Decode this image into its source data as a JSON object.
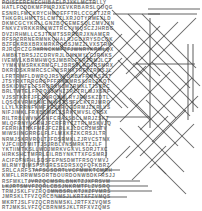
{
  "puzzle": {
    "title": "Word Search Grid",
    "type": "word-search",
    "columns": 38,
    "rows": 40,
    "cell_size_px": 5.25,
    "letter_color": "#6e6e6e",
    "mark_color": "#4a4a4a",
    "background_color": "#ffffff",
    "rows_text": [
      "POISEERENECHIBAELPJXKLMCTRLLY",
      "HATLFCDDKMFPMRJXEVKRBARSLOUQG",
      "ESNRLFMCKRYCHMDEFFTRLCCGSTJZR",
      "THKGRLHMTTSLCMTZLXRJOTYRMEXLD",
      "DKMCGCYKRLLGNZBQGEMESQLCMVJXN",
      "FNKVZVRKKRMXWZTRCYVMQSCZJHRBG",
      "DVZIRHMLLCSJTRMTSSRRBRJXNAMER",
      "RFSFZRRNERMNKQHALRJGDXRYSDCQK",
      "BZFEKRBXBRXMRKRQBSJMZZLVXSTRM",
      "RJRCRCZGRXRNCKMFZFJWNRYKRMLQX",
      "AMBKTBRSJZCDRVRJLGMXMYLCJRNKS",
      "IVEMVLKBRMHWQSJMBRLFKRZRMJLCT",
      "YYMKVMSRKKRMGFLJBRSVLKDJRSMRX",
      "DKRIDSKRMRCSCHWSRNXTRFXZRMSJL",
      "LFRTRMFLDWRQJRSVVDRBVFRMKSZJT",
      "JTSYRXTRRGRSPFFRKGMRSXJRLZKQT",
      "BSKIDWTELFSRQRXNZMZRMKLTJSVRC",
      "BRLTWTELFRRQSJMNZZRCTRLMJXSRF",
      "VJSSTKRFJFCCVRQSMLRYJRMSKZDTL",
      "LQSCKVRMBNICIMWSTSSFLCKTRJMRQ",
      "LLYLKRRNFKMFXRJSRQGDRMJZKRLVS",
      "NIFJIMKLFRXBDMRLJSRKTMVSLQRSX",
      "RILTRBLWVNYGNFCRAJSBCLMRJZSKT",
      "MLQFRNYVGRHJFCRFRYCZTRLMSKVJQ",
      "FERRIATNKFMFJFCZRLKJLDCRJMSTV",
      "MIWSIINGRRGLFLFLMXKFZKCRSJLTR",
      "NRMJSKRVRQLTJFDSRMKLZJRVCSTNX",
      "VJFCIIDTMITTJSJRBLVNSMRKTZJLF",
      "YKTIIMTKSLLWDJMRKVGKVLSDRJTXC",
      "HIRKSHCTMFRLEILRBYNKTTXFGSMRJ",
      "ACIFDFNFHLSDSFEPNSDMTFRSQYMVJ",
      "MLRMYDIMSPSIGRESEDRSXQFQFKBRZ",
      "SRLCARFSTAFSGSDRTLVCFMWKTCMRH",
      "KMFLLRRWMSORTBOURDONWBDKFRSJJ",
      "RSFMKLTJVRZQCMSRLBNKTZJXFRSVM",
      "LKJRTSMVFZQRLCBSJNKRMTFLZVSRQ",
      "TRMJSKLFVZRQCMNBSRLKTJXZFVMRS",
      "JMRSKLTFVZQRCBNMSJLKRTXFZVMQS",
      "MKRTJSLFVZQCRBNMSKLJRTFXZVQMS",
      "RTJMKSLVFZQCBRNMSJKLTRFXVZQMS"
    ],
    "marks": [
      {
        "name": "word-strike-1",
        "x1": 2,
        "y1": 3,
        "x2": 96,
        "y2": 3,
        "orientation": "horizontal"
      },
      {
        "name": "word-strike-2",
        "x1": 148,
        "y1": 9,
        "x2": 200,
        "y2": 9,
        "orientation": "horizontal"
      },
      {
        "name": "word-strike-3",
        "x1": 148,
        "y1": 14,
        "x2": 197,
        "y2": 14,
        "orientation": "horizontal"
      },
      {
        "name": "word-strike-4",
        "x1": 113,
        "y1": 14,
        "x2": 160,
        "y2": 14,
        "orientation": "horizontal"
      },
      {
        "name": "word-strike-5",
        "x1": 35,
        "y1": 49,
        "x2": 110,
        "y2": 49,
        "orientation": "horizontal"
      },
      {
        "name": "word-strike-6",
        "x1": 133,
        "y1": 64,
        "x2": 195,
        "y2": 64,
        "orientation": "horizontal"
      },
      {
        "name": "word-strike-7",
        "x1": 107,
        "y1": 117,
        "x2": 150,
        "y2": 117,
        "orientation": "horizontal"
      },
      {
        "name": "word-strike-8",
        "x1": 33,
        "y1": 170,
        "x2": 120,
        "y2": 170,
        "orientation": "horizontal"
      },
      {
        "name": "word-strike-9",
        "x1": 28,
        "y1": 181,
        "x2": 140,
        "y2": 181,
        "orientation": "horizontal"
      },
      {
        "name": "word-strike-10",
        "x1": 2,
        "y1": 186,
        "x2": 148,
        "y2": 186,
        "orientation": "horizontal"
      },
      {
        "name": "word-strike-11",
        "x1": 48,
        "y1": 191,
        "x2": 152,
        "y2": 191,
        "orientation": "horizontal"
      },
      {
        "name": "word-strike-12",
        "x1": 57,
        "y1": 197,
        "x2": 127,
        "y2": 197,
        "orientation": "horizontal"
      },
      {
        "name": "word-strike-13",
        "x1": 16,
        "y1": 38,
        "x2": 16,
        "y2": 106,
        "orientation": "vertical"
      },
      {
        "name": "word-strike-14",
        "x1": 20,
        "y1": 57,
        "x2": 20,
        "y2": 160,
        "orientation": "vertical"
      },
      {
        "name": "word-strike-15",
        "x1": 24,
        "y1": 86,
        "x2": 24,
        "y2": 168,
        "orientation": "vertical"
      },
      {
        "name": "word-strike-16",
        "x1": 29,
        "y1": 86,
        "x2": 29,
        "y2": 168,
        "orientation": "vertical"
      },
      {
        "name": "word-strike-17",
        "x1": 38,
        "y1": 93,
        "x2": 38,
        "y2": 165,
        "orientation": "vertical"
      },
      {
        "name": "word-strike-18",
        "x1": 43,
        "y1": 100,
        "x2": 43,
        "y2": 165,
        "orientation": "vertical"
      },
      {
        "name": "word-strike-19",
        "x1": 48,
        "y1": 96,
        "x2": 48,
        "y2": 168,
        "orientation": "vertical"
      },
      {
        "name": "word-strike-20",
        "x1": 60,
        "y1": 93,
        "x2": 60,
        "y2": 143,
        "orientation": "vertical"
      },
      {
        "name": "word-strike-21",
        "x1": 64,
        "y1": 78,
        "x2": 64,
        "y2": 143,
        "orientation": "vertical"
      },
      {
        "name": "word-strike-22",
        "x1": 72,
        "y1": 100,
        "x2": 72,
        "y2": 148,
        "orientation": "vertical"
      },
      {
        "name": "word-strike-23",
        "x1": 100,
        "y1": 84,
        "x2": 100,
        "y2": 130,
        "orientation": "vertical"
      },
      {
        "name": "word-strike-24",
        "x1": 106,
        "y1": 119,
        "x2": 106,
        "y2": 158,
        "orientation": "vertical"
      },
      {
        "name": "word-strike-25",
        "x1": 150,
        "y1": 18,
        "x2": 150,
        "y2": 128,
        "orientation": "vertical"
      },
      {
        "name": "word-strike-26",
        "x1": 188,
        "y1": 44,
        "x2": 188,
        "y2": 120,
        "orientation": "vertical"
      },
      {
        "name": "word-strike-27",
        "x1": 193,
        "y1": 44,
        "x2": 193,
        "y2": 112,
        "orientation": "vertical"
      },
      {
        "name": "word-strike-28",
        "x1": 22,
        "y1": 6,
        "x2": 64,
        "y2": 48,
        "orientation": "diagonal-down"
      },
      {
        "name": "word-strike-29",
        "x1": 50,
        "y1": 8,
        "x2": 92,
        "y2": 50,
        "orientation": "diagonal-down"
      },
      {
        "name": "word-strike-30",
        "x1": 100,
        "y1": 16,
        "x2": 160,
        "y2": 76,
        "orientation": "diagonal-down"
      },
      {
        "name": "word-strike-31",
        "x1": 112,
        "y1": 10,
        "x2": 190,
        "y2": 88,
        "orientation": "diagonal-down"
      },
      {
        "name": "word-strike-32",
        "x1": 128,
        "y1": 14,
        "x2": 200,
        "y2": 86,
        "orientation": "diagonal-down"
      },
      {
        "name": "word-strike-33",
        "x1": 142,
        "y1": 14,
        "x2": 196,
        "y2": 68,
        "orientation": "diagonal-down"
      },
      {
        "name": "word-strike-34",
        "x1": 104,
        "y1": 36,
        "x2": 150,
        "y2": 82,
        "orientation": "diagonal-down"
      },
      {
        "name": "word-strike-35",
        "x1": 60,
        "y1": 46,
        "x2": 122,
        "y2": 108,
        "orientation": "diagonal-down"
      },
      {
        "name": "word-strike-36",
        "x1": 74,
        "y1": 54,
        "x2": 128,
        "y2": 108,
        "orientation": "diagonal-down"
      },
      {
        "name": "word-strike-37",
        "x1": 52,
        "y1": 66,
        "x2": 108,
        "y2": 122,
        "orientation": "diagonal-down"
      },
      {
        "name": "word-strike-38",
        "x1": 86,
        "y1": 56,
        "x2": 150,
        "y2": 120,
        "orientation": "diagonal-down"
      },
      {
        "name": "word-strike-39",
        "x1": 118,
        "y1": 60,
        "x2": 176,
        "y2": 118,
        "orientation": "diagonal-down"
      },
      {
        "name": "word-strike-40",
        "x1": 136,
        "y1": 62,
        "x2": 190,
        "y2": 116,
        "orientation": "diagonal-down"
      },
      {
        "name": "word-strike-41",
        "x1": 152,
        "y1": 62,
        "x2": 198,
        "y2": 108,
        "orientation": "diagonal-down"
      },
      {
        "name": "word-strike-42",
        "x1": 40,
        "y1": 78,
        "x2": 90,
        "y2": 128,
        "orientation": "diagonal-down"
      },
      {
        "name": "word-strike-43",
        "x1": 30,
        "y1": 82,
        "x2": 76,
        "y2": 128,
        "orientation": "diagonal-down"
      },
      {
        "name": "word-strike-44",
        "x1": 130,
        "y1": 98,
        "x2": 178,
        "y2": 146,
        "orientation": "diagonal-down"
      },
      {
        "name": "word-strike-45",
        "x1": 146,
        "y1": 100,
        "x2": 194,
        "y2": 148,
        "orientation": "diagonal-down"
      },
      {
        "name": "word-strike-46",
        "x1": 120,
        "y1": 128,
        "x2": 166,
        "y2": 174,
        "orientation": "diagonal-down"
      },
      {
        "name": "word-strike-47",
        "x1": 138,
        "y1": 126,
        "x2": 184,
        "y2": 172,
        "orientation": "diagonal-down"
      },
      {
        "name": "word-strike-48",
        "x1": 158,
        "y1": 166,
        "x2": 186,
        "y2": 194,
        "orientation": "diagonal-down"
      },
      {
        "name": "word-strike-49",
        "x1": 104,
        "y1": 4,
        "x2": 62,
        "y2": 46,
        "orientation": "diagonal-up"
      },
      {
        "name": "word-strike-50",
        "x1": 196,
        "y1": 18,
        "x2": 136,
        "y2": 78,
        "orientation": "diagonal-up"
      },
      {
        "name": "word-strike-51",
        "x1": 178,
        "y1": 22,
        "x2": 126,
        "y2": 74,
        "orientation": "diagonal-up"
      },
      {
        "name": "word-strike-52",
        "x1": 160,
        "y1": 26,
        "x2": 110,
        "y2": 76,
        "orientation": "diagonal-up"
      },
      {
        "name": "word-strike-53",
        "x1": 140,
        "y1": 30,
        "x2": 94,
        "y2": 76,
        "orientation": "diagonal-up"
      },
      {
        "name": "word-strike-54",
        "x1": 122,
        "y1": 34,
        "x2": 78,
        "y2": 78,
        "orientation": "diagonal-up"
      },
      {
        "name": "word-strike-55",
        "x1": 104,
        "y1": 44,
        "x2": 56,
        "y2": 92,
        "orientation": "diagonal-up"
      },
      {
        "name": "word-strike-56",
        "x1": 90,
        "y1": 52,
        "x2": 42,
        "y2": 100,
        "orientation": "diagonal-up"
      },
      {
        "name": "word-strike-57",
        "x1": 78,
        "y1": 62,
        "x2": 34,
        "y2": 106,
        "orientation": "diagonal-up"
      },
      {
        "name": "word-strike-58",
        "x1": 122,
        "y1": 58,
        "x2": 74,
        "y2": 106,
        "orientation": "diagonal-up"
      },
      {
        "name": "word-strike-59",
        "x1": 146,
        "y1": 66,
        "x2": 100,
        "y2": 112,
        "orientation": "diagonal-up"
      },
      {
        "name": "word-strike-60",
        "x1": 170,
        "y1": 72,
        "x2": 120,
        "y2": 122,
        "orientation": "diagonal-up"
      },
      {
        "name": "word-strike-61",
        "x1": 192,
        "y1": 78,
        "x2": 140,
        "y2": 130,
        "orientation": "diagonal-up"
      },
      {
        "name": "word-strike-62",
        "x1": 198,
        "y1": 96,
        "x2": 152,
        "y2": 142,
        "orientation": "diagonal-up"
      },
      {
        "name": "word-strike-63",
        "x1": 186,
        "y1": 110,
        "x2": 140,
        "y2": 156,
        "orientation": "diagonal-up"
      },
      {
        "name": "word-strike-64",
        "x1": 168,
        "y1": 116,
        "x2": 126,
        "y2": 158,
        "orientation": "diagonal-up"
      },
      {
        "name": "word-strike-65",
        "x1": 194,
        "y1": 124,
        "x2": 150,
        "y2": 168,
        "orientation": "diagonal-up"
      },
      {
        "name": "word-strike-66",
        "x1": 92,
        "y1": 74,
        "x2": 52,
        "y2": 114,
        "orientation": "diagonal-up"
      },
      {
        "name": "word-strike-67",
        "x1": 74,
        "y1": 86,
        "x2": 36,
        "y2": 124,
        "orientation": "diagonal-up"
      },
      {
        "name": "word-strike-68",
        "x1": 60,
        "y1": 96,
        "x2": 28,
        "y2": 128,
        "orientation": "diagonal-up"
      },
      {
        "name": "word-strike-69",
        "x1": 130,
        "y1": 146,
        "x2": 100,
        "y2": 176,
        "orientation": "diagonal-up"
      },
      {
        "name": "word-strike-70",
        "x1": 166,
        "y1": 146,
        "x2": 132,
        "y2": 180,
        "orientation": "diagonal-up"
      }
    ]
  }
}
